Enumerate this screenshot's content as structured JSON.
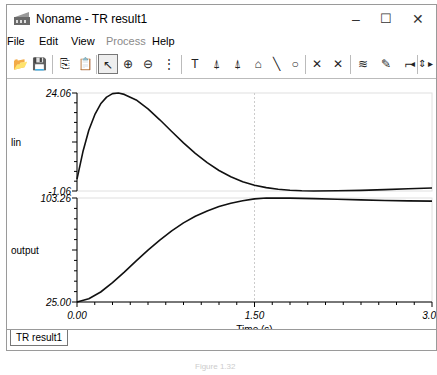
{
  "window": {
    "title": "Noname - TR result1",
    "controls": {
      "minimize": "–",
      "maximize": "☐",
      "close": "✕"
    }
  },
  "menu": [
    {
      "label": "File",
      "enabled": true
    },
    {
      "label": "Edit",
      "enabled": true
    },
    {
      "label": "View",
      "enabled": true
    },
    {
      "label": "Process",
      "enabled": false
    },
    {
      "label": "Help",
      "enabled": true
    }
  ],
  "toolbar": [
    {
      "name": "open-icon",
      "glyph": "📂"
    },
    {
      "name": "save-icon",
      "glyph": "💾"
    },
    {
      "name": "copy-icon",
      "glyph": "⎘"
    },
    {
      "name": "paste-icon",
      "glyph": "📋"
    },
    {
      "name": "pointer-icon",
      "glyph": "↖",
      "selected": true
    },
    {
      "name": "zoom-in-icon",
      "glyph": "⊕"
    },
    {
      "name": "zoom-out-icon",
      "glyph": "⊖"
    },
    {
      "name": "grid-icon",
      "glyph": "⋮"
    },
    {
      "name": "text-icon",
      "glyph": "T"
    },
    {
      "name": "cursor-a-icon",
      "glyph": "⍋"
    },
    {
      "name": "cursor-b-icon",
      "glyph": "⍋"
    },
    {
      "name": "curve-label-icon",
      "glyph": "⌂"
    },
    {
      "name": "line-icon",
      "glyph": "╲"
    },
    {
      "name": "circle-icon",
      "glyph": "○"
    },
    {
      "name": "marker-a-icon",
      "glyph": "✕"
    },
    {
      "name": "marker-b-icon",
      "glyph": "✕"
    },
    {
      "name": "add-curve-icon",
      "glyph": "≋"
    },
    {
      "name": "pen-icon",
      "glyph": "✎"
    },
    {
      "name": "polyline-icon",
      "glyph": "⌐"
    },
    {
      "name": "scroll-left-icon",
      "glyph": "◂"
    },
    {
      "name": "scroll-updown-icon",
      "glyph": "⇕"
    },
    {
      "name": "scroll-right-icon",
      "glyph": "▸"
    }
  ],
  "tabs": [
    {
      "label": "TR result1"
    }
  ],
  "caption": "Figure 1.32",
  "chart_data": [
    {
      "type": "line",
      "title": "",
      "ylabel": "lin",
      "xlabel": "",
      "xlim": [
        0,
        3
      ],
      "ylim": [
        -1.06,
        24.06
      ],
      "ytick_labels": [
        "24.06",
        "-1.06"
      ],
      "x": [
        0,
        0.05,
        0.1,
        0.15,
        0.2,
        0.25,
        0.3,
        0.35,
        0.4,
        0.5,
        0.6,
        0.7,
        0.8,
        0.9,
        1.0,
        1.1,
        1.2,
        1.3,
        1.4,
        1.5,
        1.6,
        1.7,
        1.8,
        1.9,
        2.0,
        2.2,
        2.4,
        2.6,
        2.8,
        3.0
      ],
      "series": [
        {
          "name": "lin",
          "values": [
            2.0,
            9.0,
            14.5,
            18.5,
            21.3,
            23.0,
            23.9,
            24.06,
            23.7,
            22.3,
            20.0,
            17.2,
            14.2,
            11.3,
            8.6,
            6.2,
            4.2,
            2.6,
            1.3,
            0.4,
            -0.2,
            -0.6,
            -0.85,
            -1.0,
            -1.06,
            -1.0,
            -0.9,
            -0.7,
            -0.5,
            -0.3
          ]
        }
      ],
      "grid": {
        "vertical_at": [
          1.5
        ]
      }
    },
    {
      "type": "line",
      "title": "",
      "ylabel": "output",
      "xlabel": "Time (s)",
      "xlim": [
        0,
        3
      ],
      "ylim": [
        25.0,
        103.26
      ],
      "ytick_labels": [
        "103.26",
        "25.00"
      ],
      "xtick_labels": [
        "0.00",
        "1.50",
        "3.00"
      ],
      "x": [
        0,
        0.1,
        0.2,
        0.3,
        0.4,
        0.5,
        0.6,
        0.7,
        0.8,
        0.9,
        1.0,
        1.1,
        1.2,
        1.3,
        1.4,
        1.5,
        1.6,
        1.8,
        2.0,
        2.2,
        2.4,
        2.6,
        2.8,
        3.0
      ],
      "series": [
        {
          "name": "output",
          "values": [
            25.0,
            27.5,
            32.5,
            39.5,
            47.5,
            56.0,
            64.0,
            71.5,
            78.5,
            84.5,
            89.5,
            93.5,
            96.8,
            99.3,
            101.2,
            102.6,
            103.26,
            103.2,
            102.8,
            102.3,
            101.8,
            101.4,
            101.1,
            100.9
          ]
        }
      ],
      "grid": {
        "vertical_at": [
          1.5
        ]
      }
    }
  ]
}
